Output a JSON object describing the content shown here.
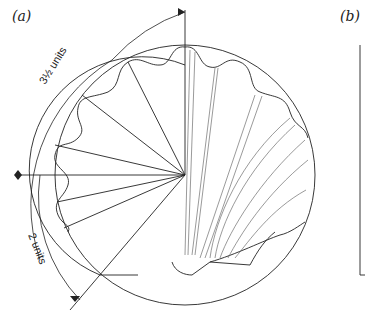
{
  "figure": {
    "panel_a_label": "(a)",
    "panel_b_label": "(b)",
    "dimension_top": "3½ units",
    "dimension_bottom": "2 units"
  }
}
